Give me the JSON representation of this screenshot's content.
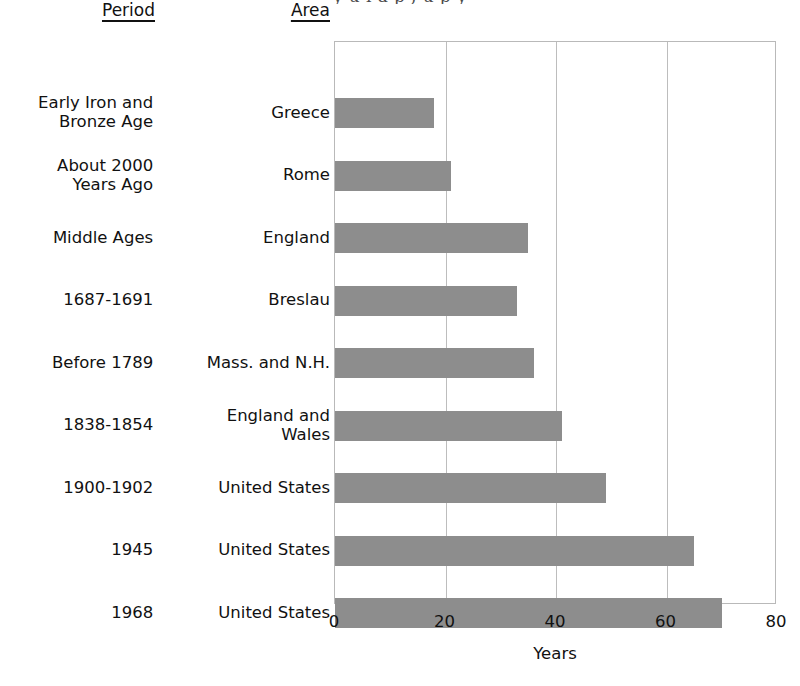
{
  "figure": {
    "title_remnant": "y  u  i  a  p ,  u   p y",
    "bar_color": "#8d8d8d",
    "frame_color": "#b9b9b9",
    "grid_color": "#bdbdbd"
  },
  "columns": {
    "period_header": "Period",
    "area_header": "Area"
  },
  "axis": {
    "title": "Years",
    "ticks": [
      "0",
      "20",
      "40",
      "60",
      "80"
    ]
  },
  "chart_data": {
    "type": "bar",
    "orientation": "horizontal",
    "title": "",
    "xlabel": "Years",
    "ylabel": "",
    "xlim": [
      0,
      80
    ],
    "xticks": [
      0,
      20,
      40,
      60,
      80
    ],
    "grid": true,
    "legend": "none",
    "categories": [
      "Greece",
      "Rome",
      "England",
      "Breslau",
      "Mass. and N.H.",
      "England and Wales",
      "United States",
      "United States",
      "United States"
    ],
    "values": [
      18,
      21,
      35,
      33,
      36,
      41,
      49,
      65,
      70
    ],
    "periods": [
      "Early Iron and Bronze Age",
      "About 2000 Years Ago",
      "Middle Ages",
      "1687-1691",
      "Before 1789",
      "1838-1854",
      "1900-1902",
      "1945",
      "1968"
    ]
  },
  "rows": [
    {
      "period": "Early Iron and\nBronze Age",
      "period_line1": "Early Iron and",
      "period_line2": "Bronze Age",
      "area": "Greece",
      "area_line1": "Greece",
      "area_line2": "",
      "value": 18
    },
    {
      "period": "About 2000\nYears Ago",
      "period_line1": "About 2000",
      "period_line2": "Years Ago",
      "area": "Rome",
      "area_line1": "Rome",
      "area_line2": "",
      "value": 21
    },
    {
      "period": "Middle Ages",
      "period_line1": "Middle Ages",
      "period_line2": "",
      "area": "England",
      "area_line1": "England",
      "area_line2": "",
      "value": 35
    },
    {
      "period": "1687-1691",
      "period_line1": "1687-1691",
      "period_line2": "",
      "area": "Breslau",
      "area_line1": "Breslau",
      "area_line2": "",
      "value": 33
    },
    {
      "period": "Before 1789",
      "period_line1": "Before 1789",
      "period_line2": "",
      "area": "Mass. and N.H.",
      "area_line1": "Mass. and N.H.",
      "area_line2": "",
      "value": 36
    },
    {
      "period": "1838-1854",
      "period_line1": "1838-1854",
      "period_line2": "",
      "area": "England and\nWales",
      "area_line1": "England and",
      "area_line2": "Wales",
      "value": 41
    },
    {
      "period": "1900-1902",
      "period_line1": "1900-1902",
      "period_line2": "",
      "area": "United States",
      "area_line1": "United States",
      "area_line2": "",
      "value": 49
    },
    {
      "period": "1945",
      "period_line1": "1945",
      "period_line2": "",
      "area": "United States",
      "area_line1": "United States",
      "area_line2": "",
      "value": 65
    },
    {
      "period": "1968",
      "period_line1": "1968",
      "period_line2": "",
      "area": "United States",
      "area_line1": "United States",
      "area_line2": "",
      "value": 70
    }
  ]
}
